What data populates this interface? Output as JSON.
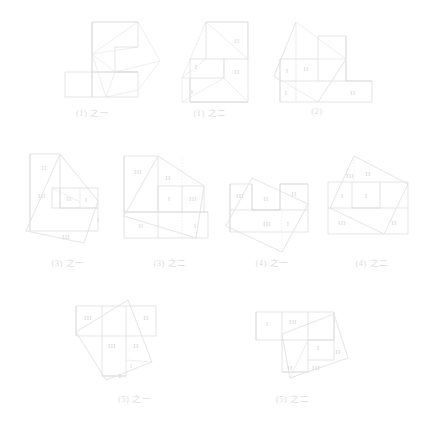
{
  "page": {
    "background": "#ffffff",
    "line_color": "#dadada",
    "cut_color": "#e2e2e2",
    "label_color": "#d6d6d6",
    "caption_color": "#dcdcdc"
  },
  "figures": [
    {
      "id": "fig-1-a",
      "caption": "(1) 之一",
      "labels": []
    },
    {
      "id": "fig-1-b",
      "caption": "(1) 之二",
      "labels": [
        "II",
        "I",
        "II",
        "I"
      ]
    },
    {
      "id": "fig-2",
      "caption": "(2)",
      "labels": [
        "I",
        "II",
        "I",
        "II"
      ]
    },
    {
      "id": "fig-3-a",
      "caption": "(3) 之一",
      "labels": [
        "II",
        "III",
        "II",
        "I",
        "I",
        "III"
      ]
    },
    {
      "id": "fig-3-b",
      "caption": "(3) 之二",
      "labels": [
        "III",
        "II",
        "I",
        "III",
        "II",
        "I"
      ]
    },
    {
      "id": "fig-4-a",
      "caption": "(4) 之一",
      "labels": [
        "III",
        "II",
        "II",
        "III",
        "I"
      ]
    },
    {
      "id": "fig-4-b",
      "caption": "(4) 之二",
      "labels": [
        "III",
        "II",
        "I",
        "I",
        "III",
        "II"
      ]
    },
    {
      "id": "fig-5-a",
      "caption": "(5) 之一",
      "labels": [
        "III",
        "II",
        "III",
        "II",
        "I",
        "I"
      ]
    },
    {
      "id": "fig-5-b",
      "caption": "(5) 之二",
      "labels": [
        "I",
        "III",
        "I",
        "II",
        "II",
        "III"
      ]
    }
  ]
}
